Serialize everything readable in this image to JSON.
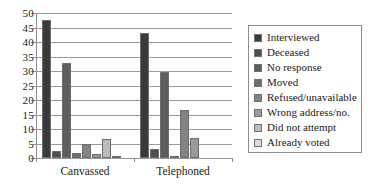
{
  "chart_data": {
    "type": "bar",
    "title": "",
    "xlabel": "",
    "ylabel": "",
    "ylim": [
      0,
      50
    ],
    "yticks": [
      0,
      5,
      10,
      15,
      20,
      25,
      30,
      35,
      40,
      45,
      50
    ],
    "grid": true,
    "legend_position": "right",
    "categories": [
      "Canvassed",
      "Telephoned"
    ],
    "series": [
      {
        "name": "Interviewed",
        "color": "#3a3a3a",
        "values": [
          47.7,
          43.1
        ]
      },
      {
        "name": "Deceased",
        "color": "#4f4f4f",
        "values": [
          2.4,
          3.2
        ]
      },
      {
        "name": "No response",
        "color": "#5e5e5e",
        "values": [
          32.7,
          29.8
        ]
      },
      {
        "name": "Moved",
        "color": "#6e6e6e",
        "values": [
          1.9,
          0.5
        ]
      },
      {
        "name": "Refused/unavailable",
        "color": "#838383",
        "values": [
          4.9,
          16.6
        ]
      },
      {
        "name": "Wrong address/no.",
        "color": "#9a9a9a",
        "values": [
          1.3,
          7.0
        ]
      },
      {
        "name": "Did not attempt",
        "color": "#bcbcbc",
        "values": [
          6.7,
          0
        ]
      },
      {
        "name": "Already voted",
        "color": "#dcdcdc",
        "values": [
          0.5,
          0
        ]
      }
    ]
  }
}
